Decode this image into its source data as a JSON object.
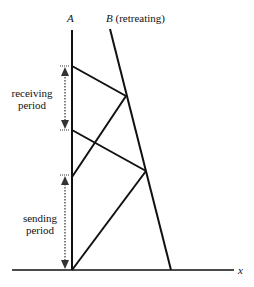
{
  "labels": {
    "a": "A",
    "b": "B",
    "b_note": "(retreating)",
    "receiving_1": "receiving",
    "receiving_2": "period",
    "sending_1": "sending",
    "sending_2": "period",
    "x_axis": "x"
  },
  "colors": {
    "line": "#111111",
    "arrow": "#333333"
  }
}
